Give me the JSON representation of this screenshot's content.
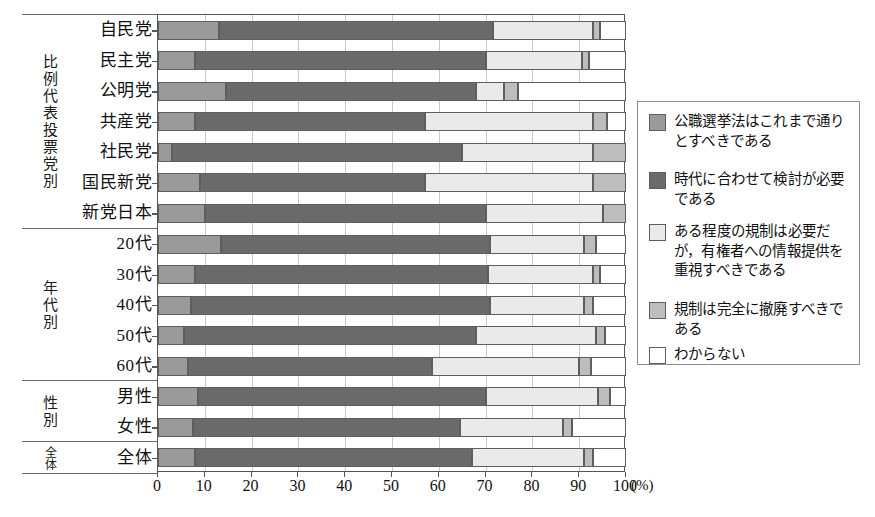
{
  "chart_data": {
    "type": "bar",
    "orientation": "horizontal",
    "stacked": true,
    "percent": true,
    "title": "",
    "xlabel": "(%)",
    "ylabel": "",
    "xlim": [
      0,
      100
    ],
    "xticks": [
      0,
      10,
      20,
      30,
      40,
      50,
      60,
      70,
      80,
      90,
      100
    ],
    "xtick_labels": [
      "0",
      "10",
      "20",
      "30",
      "40",
      "50",
      "60",
      "70",
      "80",
      "90",
      "100"
    ],
    "unit_label": "(%)",
    "grid": true,
    "legend_position": "right",
    "series": [
      {
        "name": "公職選挙法はこれまで通りとすべきである",
        "color": "#9a9a9a",
        "values": [
          13.0,
          8.0,
          14.5,
          8.0,
          3.0,
          9.0,
          10.0,
          13.5,
          8.0,
          7.0,
          5.5,
          6.5,
          8.5,
          7.5,
          8.0
        ]
      },
      {
        "name": "時代に合わせて検討が必要である",
        "color": "#6a6a6a",
        "values": [
          58.5,
          62.0,
          53.5,
          49.0,
          62.0,
          48.0,
          60.0,
          57.5,
          62.5,
          64.0,
          62.5,
          52.0,
          61.5,
          57.0,
          59.0
        ]
      },
      {
        "name": "ある程度の規制は必要だが，有権者への情報提供を重視すべきである",
        "color": "#eaeaea",
        "values": [
          21.5,
          20.5,
          6.0,
          36.0,
          28.0,
          36.0,
          25.0,
          20.0,
          22.5,
          20.0,
          25.5,
          31.5,
          24.0,
          22.0,
          24.0
        ]
      },
      {
        "name": "規制は完全に撤廃すべきである",
        "color": "#bdbdbd",
        "values": [
          1.5,
          1.5,
          3.0,
          3.0,
          7.0,
          7.0,
          5.0,
          2.5,
          1.5,
          2.0,
          2.0,
          2.5,
          2.5,
          2.0,
          2.0
        ]
      },
      {
        "name": "わからない",
        "color": "#ffffff",
        "values": [
          5.5,
          8.0,
          23.0,
          4.0,
          0.0,
          0.0,
          0.0,
          6.5,
          5.5,
          7.0,
          4.5,
          7.5,
          3.5,
          11.5,
          7.0
        ]
      }
    ],
    "categories": [
      "自民党",
      "民主党",
      "公明党",
      "共産党",
      "社民党",
      "国民新党",
      "新党日本",
      "20代",
      "30代",
      "40代",
      "50代",
      "60代",
      "男性",
      "女性",
      "全体"
    ],
    "groups": [
      {
        "name": "比例代表投票党別",
        "categories": [
          "自民党",
          "民主党",
          "公明党",
          "共産党",
          "社民党",
          "国民新党",
          "新党日本"
        ]
      },
      {
        "name": "年代別",
        "categories": [
          "20代",
          "30代",
          "40代",
          "50代",
          "60代"
        ]
      },
      {
        "name": "性別",
        "categories": [
          "男性",
          "女性"
        ]
      },
      {
        "name": "全体",
        "categories": [
          "全体"
        ]
      }
    ]
  },
  "legend": {
    "items": [
      {
        "label": "公職選挙法はこれまで通りとすべきである",
        "color": "#9a9a9a"
      },
      {
        "label": "時代に合わせて検討が必要である",
        "color": "#6a6a6a"
      },
      {
        "label": "ある程度の規制は必要だが，有権者への情報提供を重視すべきである",
        "color": "#eaeaea"
      },
      {
        "label": "規制は完全に撤廃すべきである",
        "color": "#bdbdbd"
      },
      {
        "label": "わからない",
        "color": "#ffffff"
      }
    ]
  }
}
